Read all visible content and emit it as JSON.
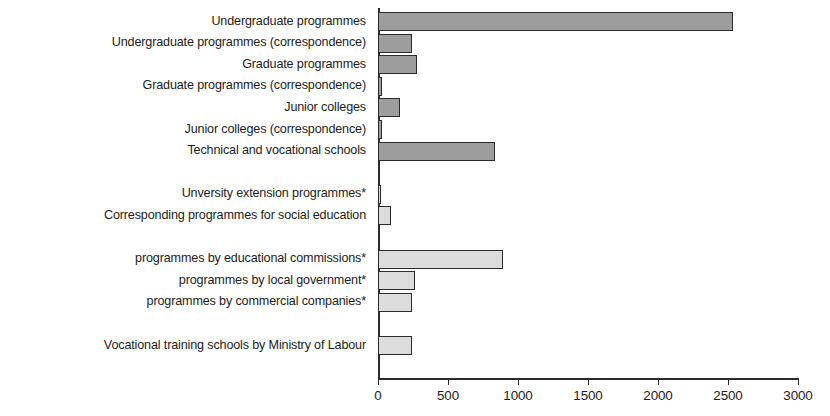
{
  "chart_data": {
    "type": "bar",
    "orientation": "horizontal",
    "title": "",
    "subtitle": "",
    "xlabel": "",
    "ylabel": "",
    "xlim": [
      0,
      3000
    ],
    "xticks": [
      0,
      500,
      1000,
      1500,
      2000,
      2500,
      3000
    ],
    "xtick_labels": [
      "0",
      "500",
      "1000",
      "1500",
      "2000",
      "2500",
      "3000"
    ],
    "grid": false,
    "legend": false,
    "legend_position": "none",
    "categories": [
      "Undergraduate programmes",
      "Undergraduate programmes (correspondence)",
      "Graduate programmes",
      "Graduate programmes (correspondence)",
      "Junior colleges",
      "Junior colleges (correspondence)",
      "Technical and vocational schools",
      "Unversity extension programmes*",
      "Corresponding programmes for social education",
      "programmes by educational commissions*",
      "programmes by local government*",
      "programmes by commercial companies*",
      "Vocational training schools by Ministry of Labour"
    ],
    "values": [
      2535,
      245,
      280,
      25,
      160,
      30,
      835,
      20,
      95,
      890,
      265,
      245,
      245
    ],
    "colors": {
      "dark_bar": "#9d9d9d",
      "light_bar": "#dcdcdc",
      "bar_outline": "#2b2b2b",
      "axis": "#2b2b2b",
      "text": "#1c1c1c",
      "background": "#ffffff"
    },
    "bars": [
      {
        "label": "Undergraduate programmes",
        "value": 2535,
        "shade": "dark",
        "row": 0,
        "group": 1
      },
      {
        "label": "Undergraduate programmes (correspondence)",
        "value": 245,
        "shade": "dark",
        "row": 1,
        "group": 1
      },
      {
        "label": "Graduate programmes",
        "value": 280,
        "shade": "dark",
        "row": 2,
        "group": 1
      },
      {
        "label": "Graduate programmes (correspondence)",
        "value": 25,
        "shade": "dark",
        "row": 3,
        "group": 1
      },
      {
        "label": "Junior colleges",
        "value": 160,
        "shade": "dark",
        "row": 4,
        "group": 1
      },
      {
        "label": "Junior colleges (correspondence)",
        "value": 30,
        "shade": "dark",
        "row": 5,
        "group": 1
      },
      {
        "label": "Technical and vocational schools",
        "value": 835,
        "shade": "dark",
        "row": 6,
        "group": 1
      },
      {
        "label": "Unversity extension programmes*",
        "value": 20,
        "shade": "light",
        "row": 8,
        "group": 2
      },
      {
        "label": "Corresponding programmes for social education",
        "value": 95,
        "shade": "light",
        "row": 9,
        "group": 2
      },
      {
        "label": "programmes by educational commissions*",
        "value": 890,
        "shade": "light",
        "row": 11,
        "group": 3
      },
      {
        "label": "programmes by local government*",
        "value": 265,
        "shade": "light",
        "row": 12,
        "group": 3
      },
      {
        "label": "programmes by commercial companies*",
        "value": 245,
        "shade": "light",
        "row": 13,
        "group": 3
      },
      {
        "label": "Vocational training schools by Ministry of Labour",
        "value": 245,
        "shade": "light",
        "row": 15,
        "group": 4
      }
    ]
  }
}
